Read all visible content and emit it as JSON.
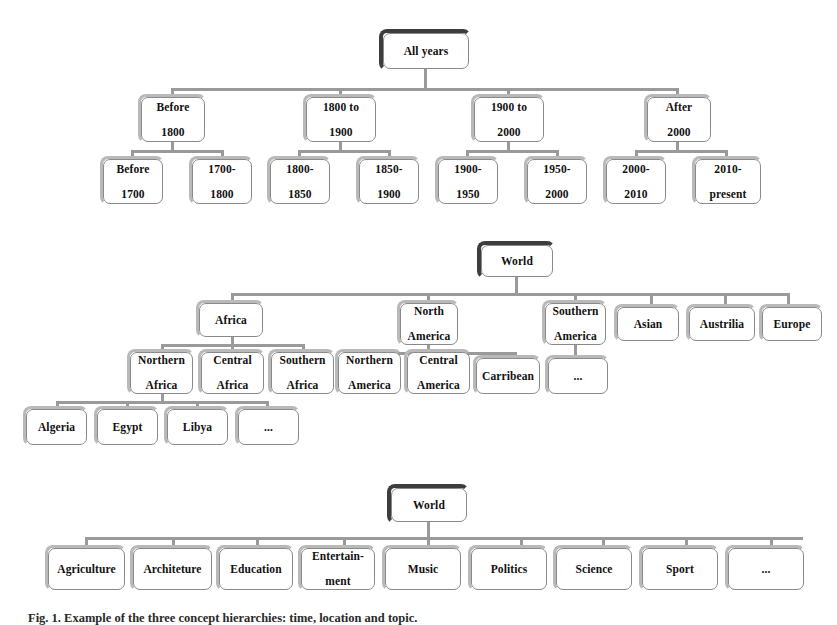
{
  "figure": {
    "caption": "Fig. 1.  Example of the three concept hierarchies: time, location and topic.",
    "colors": {
      "box_border": "#8a8a8a",
      "box_shadow": "#b9b9b9",
      "root_shadow": "#3d3d3d",
      "connector": "#9a9a9a",
      "text": "#111111",
      "background": "#ffffff"
    }
  },
  "trees": [
    {
      "name": "time-hierarchy",
      "root": {
        "label": "All years"
      },
      "level2": [
        {
          "label": "Before\n1800",
          "line1": "Before",
          "line2": "1800"
        },
        {
          "label": "1800 to\n1900",
          "line1": "1800 to",
          "line2": "1900"
        },
        {
          "label": "1900 to\n2000",
          "line1": "1900 to",
          "line2": "2000"
        },
        {
          "label": "After\n2000",
          "line1": "After",
          "line2": "2000"
        }
      ],
      "level3": [
        {
          "line1": "Before",
          "line2": "1700"
        },
        {
          "line1": "1700-",
          "line2": "1800"
        },
        {
          "line1": "1800-",
          "line2": "1850"
        },
        {
          "line1": "1850-",
          "line2": "1900"
        },
        {
          "line1": "1900-",
          "line2": "1950"
        },
        {
          "line1": "1950-",
          "line2": "2000"
        },
        {
          "line1": "2000-",
          "line2": "2010"
        },
        {
          "line1": "2010-",
          "line2": "present"
        }
      ]
    },
    {
      "name": "location-hierarchy",
      "root": {
        "label": "World"
      },
      "level2": [
        {
          "line1": "Africa",
          "line2": ""
        },
        {
          "line1": "North",
          "line2": "America"
        },
        {
          "line1": "Southern",
          "line2": "America"
        },
        {
          "line1": "Asian",
          "line2": ""
        },
        {
          "line1": "Austrilia",
          "line2": ""
        },
        {
          "line1": "Europe",
          "line2": ""
        }
      ],
      "level3": [
        {
          "line1": "Northern",
          "line2": "Africa"
        },
        {
          "line1": "Central",
          "line2": "Africa"
        },
        {
          "line1": "Southern",
          "line2": "Africa"
        },
        {
          "line1": "Northern",
          "line2": "America"
        },
        {
          "line1": "Central",
          "line2": "America"
        },
        {
          "line1": "Carribean",
          "line2": ""
        },
        {
          "line1": "...",
          "line2": ""
        }
      ],
      "level4": [
        {
          "line1": "Algeria",
          "line2": ""
        },
        {
          "line1": "Egypt",
          "line2": ""
        },
        {
          "line1": "Libya",
          "line2": ""
        },
        {
          "line1": "...",
          "line2": ""
        }
      ]
    },
    {
      "name": "topic-hierarchy",
      "root": {
        "label": "World"
      },
      "level2": [
        {
          "line1": "Agriculture",
          "line2": ""
        },
        {
          "line1": "Architeture",
          "line2": ""
        },
        {
          "line1": "Education",
          "line2": ""
        },
        {
          "line1": "Entertain-",
          "line2": "ment"
        },
        {
          "line1": "Music",
          "line2": ""
        },
        {
          "line1": "Politics",
          "line2": ""
        },
        {
          "line1": "Science",
          "line2": ""
        },
        {
          "line1": "Sport",
          "line2": ""
        },
        {
          "line1": "...",
          "line2": ""
        }
      ]
    }
  ]
}
